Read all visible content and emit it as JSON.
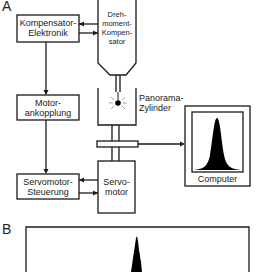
{
  "panels": {
    "a_label": "A",
    "b_label": "B"
  },
  "blocks": {
    "kompensator_elektronik": {
      "line1": "Kompensator-",
      "line2": "Elektronik"
    },
    "drehmoment_kompensator": {
      "line1": "Dreh-",
      "line2": "moment-",
      "line3": "Kompen-",
      "line4": "sator"
    },
    "motorankopplung": {
      "line1": "Motor-",
      "line2": "ankopplung"
    },
    "panorama_zylinder": {
      "line1": "Panorama-",
      "line2": "Zylinder"
    },
    "servomotor_steuerung": {
      "line1": "Servomotor-",
      "line2": "Steuerung"
    },
    "servomotor": {
      "line1": "Servo-",
      "line2": "motor"
    },
    "computer": {
      "label": "Computer"
    }
  },
  "colors": {
    "stroke": "#1a1a1a",
    "fill": "#000000",
    "background": "#ffffff"
  }
}
